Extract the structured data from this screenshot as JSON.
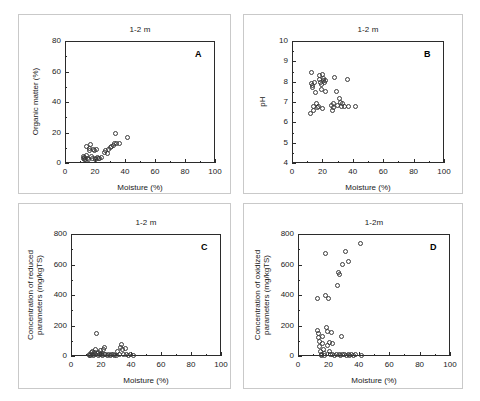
{
  "figure": {
    "panel_count": 4,
    "marker": "open-circle",
    "marker_color": "#3a3a3a",
    "axis_color": "#2b2b2b",
    "background": "#ffffff"
  },
  "chart_data": [
    {
      "type": "scatter",
      "panel": "A",
      "title": "1-2 m",
      "xlabel": "Moisture (%)",
      "ylabel": "Organic matter (%)",
      "xlim": [
        0,
        100
      ],
      "ylim": [
        0,
        80
      ],
      "xticks": [
        0,
        20,
        40,
        60,
        80,
        100
      ],
      "yticks": [
        0,
        20,
        40,
        60,
        80
      ],
      "grid": false,
      "legend": "none",
      "points": [
        {
          "x": 12.0,
          "y": 3.0
        },
        {
          "x": 12.4,
          "y": 4.5
        },
        {
          "x": 12.8,
          "y": 2.2
        },
        {
          "x": 13.2,
          "y": 3.6
        },
        {
          "x": 13.6,
          "y": 2.0
        },
        {
          "x": 14.0,
          "y": 11.0
        },
        {
          "x": 14.5,
          "y": 5.0
        },
        {
          "x": 15.0,
          "y": 3.2
        },
        {
          "x": 15.4,
          "y": 2.4
        },
        {
          "x": 16.0,
          "y": 9.5
        },
        {
          "x": 16.5,
          "y": 8.2
        },
        {
          "x": 17.0,
          "y": 12.0
        },
        {
          "x": 17.6,
          "y": 4.0
        },
        {
          "x": 18.2,
          "y": 3.0
        },
        {
          "x": 18.8,
          "y": 9.0
        },
        {
          "x": 19.4,
          "y": 8.5
        },
        {
          "x": 20.0,
          "y": 3.2
        },
        {
          "x": 20.6,
          "y": 2.6
        },
        {
          "x": 21.2,
          "y": 9.0
        },
        {
          "x": 21.8,
          "y": 3.4
        },
        {
          "x": 22.4,
          "y": 2.8
        },
        {
          "x": 23.0,
          "y": 3.0
        },
        {
          "x": 24.0,
          "y": 3.4
        },
        {
          "x": 26.0,
          "y": 7.0
        },
        {
          "x": 27.0,
          "y": 8.0
        },
        {
          "x": 28.0,
          "y": 6.0
        },
        {
          "x": 29.0,
          "y": 9.0
        },
        {
          "x": 30.0,
          "y": 10.0
        },
        {
          "x": 31.0,
          "y": 11.0
        },
        {
          "x": 32.0,
          "y": 11.5
        },
        {
          "x": 33.0,
          "y": 12.5
        },
        {
          "x": 33.5,
          "y": 19.5
        },
        {
          "x": 34.5,
          "y": 12.5
        },
        {
          "x": 36.0,
          "y": 13.0
        },
        {
          "x": 41.5,
          "y": 16.5
        }
      ]
    },
    {
      "type": "scatter",
      "panel": "B",
      "title": "1-2 m",
      "xlabel": "Moisture (%)",
      "ylabel": "pH",
      "xlim": [
        0,
        100
      ],
      "ylim": [
        4,
        10
      ],
      "xticks": [
        0,
        20,
        40,
        60,
        80,
        100
      ],
      "yticks": [
        4,
        5,
        6,
        7,
        8,
        9,
        10
      ],
      "grid": false,
      "legend": "none",
      "points": [
        {
          "x": 12.3,
          "y": 6.45
        },
        {
          "x": 12.6,
          "y": 7.9
        },
        {
          "x": 12.8,
          "y": 8.45
        },
        {
          "x": 13.2,
          "y": 7.8
        },
        {
          "x": 13.6,
          "y": 7.7
        },
        {
          "x": 13.9,
          "y": 6.8
        },
        {
          "x": 14.3,
          "y": 6.6
        },
        {
          "x": 15.0,
          "y": 7.95
        },
        {
          "x": 15.4,
          "y": 7.45
        },
        {
          "x": 16.2,
          "y": 6.95
        },
        {
          "x": 16.8,
          "y": 6.75
        },
        {
          "x": 17.4,
          "y": 6.8
        },
        {
          "x": 18.0,
          "y": 8.3
        },
        {
          "x": 18.4,
          "y": 8.1
        },
        {
          "x": 18.8,
          "y": 7.95
        },
        {
          "x": 19.2,
          "y": 7.85
        },
        {
          "x": 19.6,
          "y": 7.6
        },
        {
          "x": 19.9,
          "y": 6.7
        },
        {
          "x": 20.3,
          "y": 8.35
        },
        {
          "x": 20.7,
          "y": 8.15
        },
        {
          "x": 21.0,
          "y": 8.05
        },
        {
          "x": 21.4,
          "y": 7.95
        },
        {
          "x": 21.8,
          "y": 7.5
        },
        {
          "x": 22.2,
          "y": 8.05
        },
        {
          "x": 26.0,
          "y": 6.85
        },
        {
          "x": 26.6,
          "y": 6.6
        },
        {
          "x": 27.0,
          "y": 6.95
        },
        {
          "x": 27.6,
          "y": 6.75
        },
        {
          "x": 28.0,
          "y": 8.2
        },
        {
          "x": 29.5,
          "y": 7.5
        },
        {
          "x": 30.2,
          "y": 6.85
        },
        {
          "x": 31.0,
          "y": 7.15
        },
        {
          "x": 31.6,
          "y": 7.0
        },
        {
          "x": 32.4,
          "y": 6.8
        },
        {
          "x": 33.5,
          "y": 6.95
        },
        {
          "x": 34.5,
          "y": 6.8
        },
        {
          "x": 36.5,
          "y": 8.1
        },
        {
          "x": 37.0,
          "y": 6.8
        },
        {
          "x": 41.5,
          "y": 6.8
        }
      ]
    },
    {
      "type": "scatter",
      "panel": "C",
      "title": "1-2 m",
      "xlabel": "Moisture (%)",
      "ylabel": "Concentration of reduced\nparameters (mg/kgTS)",
      "xlim": [
        0,
        100
      ],
      "ylim": [
        0,
        800
      ],
      "xticks": [
        0,
        20,
        40,
        60,
        80,
        100
      ],
      "yticks": [
        0,
        200,
        400,
        600,
        800
      ],
      "grid": false,
      "legend": "none",
      "points": [
        {
          "x": 12.0,
          "y": 5
        },
        {
          "x": 12.5,
          "y": 12
        },
        {
          "x": 13.0,
          "y": 3
        },
        {
          "x": 13.5,
          "y": 20
        },
        {
          "x": 14.0,
          "y": 8
        },
        {
          "x": 14.5,
          "y": 30
        },
        {
          "x": 15.0,
          "y": 6
        },
        {
          "x": 15.5,
          "y": 25
        },
        {
          "x": 16.0,
          "y": 40
        },
        {
          "x": 16.5,
          "y": 10
        },
        {
          "x": 17.0,
          "y": 148
        },
        {
          "x": 17.5,
          "y": 18
        },
        {
          "x": 18.0,
          "y": 6
        },
        {
          "x": 18.5,
          "y": 22
        },
        {
          "x": 19.0,
          "y": 10
        },
        {
          "x": 19.5,
          "y": 35
        },
        {
          "x": 20.0,
          "y": 8
        },
        {
          "x": 20.5,
          "y": 15
        },
        {
          "x": 21.0,
          "y": 5
        },
        {
          "x": 21.5,
          "y": 45
        },
        {
          "x": 22.0,
          "y": 55
        },
        {
          "x": 22.5,
          "y": 12
        },
        {
          "x": 23.0,
          "y": 8
        },
        {
          "x": 24.0,
          "y": 6
        },
        {
          "x": 25.0,
          "y": 10
        },
        {
          "x": 26.0,
          "y": 5
        },
        {
          "x": 27.0,
          "y": 8
        },
        {
          "x": 28.0,
          "y": 12
        },
        {
          "x": 29.0,
          "y": 6
        },
        {
          "x": 30.0,
          "y": 5
        },
        {
          "x": 31.0,
          "y": 30
        },
        {
          "x": 32.0,
          "y": 10
        },
        {
          "x": 33.0,
          "y": 55
        },
        {
          "x": 33.8,
          "y": 78
        },
        {
          "x": 34.5,
          "y": 40
        },
        {
          "x": 35.2,
          "y": 8
        },
        {
          "x": 36.0,
          "y": 50
        },
        {
          "x": 36.8,
          "y": 12
        },
        {
          "x": 38.0,
          "y": 6
        },
        {
          "x": 39.5,
          "y": 8
        },
        {
          "x": 41.5,
          "y": 5
        }
      ]
    },
    {
      "type": "scatter",
      "panel": "D",
      "title": "1-2m",
      "xlabel": "Moisture (%)",
      "ylabel": "Concentration of oxidized\nparameters (mg/kgTS)",
      "xlim": [
        0,
        100
      ],
      "ylim": [
        0,
        800
      ],
      "xticks": [
        0,
        20,
        40,
        60,
        80,
        100
      ],
      "yticks": [
        0,
        200,
        400,
        600,
        800
      ],
      "grid": false,
      "legend": "none",
      "points": [
        {
          "x": 12.5,
          "y": 380
        },
        {
          "x": 13.0,
          "y": 170
        },
        {
          "x": 13.3,
          "y": 150
        },
        {
          "x": 13.6,
          "y": 120
        },
        {
          "x": 14.0,
          "y": 95
        },
        {
          "x": 14.4,
          "y": 60
        },
        {
          "x": 14.8,
          "y": 30
        },
        {
          "x": 15.2,
          "y": 10
        },
        {
          "x": 15.6,
          "y": 5
        },
        {
          "x": 16.0,
          "y": 130
        },
        {
          "x": 16.4,
          "y": 80
        },
        {
          "x": 16.8,
          "y": 45
        },
        {
          "x": 17.2,
          "y": 15
        },
        {
          "x": 17.6,
          "y": 5
        },
        {
          "x": 18.0,
          "y": 675
        },
        {
          "x": 18.4,
          "y": 395
        },
        {
          "x": 18.8,
          "y": 185
        },
        {
          "x": 19.2,
          "y": 160
        },
        {
          "x": 19.6,
          "y": 70
        },
        {
          "x": 20.0,
          "y": 375
        },
        {
          "x": 20.4,
          "y": 90
        },
        {
          "x": 20.8,
          "y": 30
        },
        {
          "x": 21.2,
          "y": 10
        },
        {
          "x": 22.0,
          "y": 155
        },
        {
          "x": 22.5,
          "y": 85
        },
        {
          "x": 23.0,
          "y": 8
        },
        {
          "x": 24.0,
          "y": 5
        },
        {
          "x": 25.0,
          "y": 10
        },
        {
          "x": 26.0,
          "y": 465
        },
        {
          "x": 26.5,
          "y": 545
        },
        {
          "x": 27.0,
          "y": 535
        },
        {
          "x": 27.5,
          "y": 8
        },
        {
          "x": 28.0,
          "y": 5
        },
        {
          "x": 28.5,
          "y": 125
        },
        {
          "x": 29.0,
          "y": 600
        },
        {
          "x": 29.5,
          "y": 10
        },
        {
          "x": 30.5,
          "y": 8
        },
        {
          "x": 31.5,
          "y": 685
        },
        {
          "x": 32.0,
          "y": 5
        },
        {
          "x": 33.0,
          "y": 12
        },
        {
          "x": 33.5,
          "y": 620
        },
        {
          "x": 34.0,
          "y": 6
        },
        {
          "x": 35.0,
          "y": 8
        },
        {
          "x": 36.5,
          "y": 5
        },
        {
          "x": 38.0,
          "y": 10
        },
        {
          "x": 41.0,
          "y": 735
        },
        {
          "x": 42.0,
          "y": 5
        }
      ]
    }
  ]
}
